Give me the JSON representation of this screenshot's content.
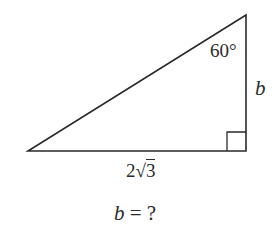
{
  "diagram": {
    "type": "right-triangle",
    "vertices": {
      "left": [
        28,
        151
      ],
      "right_angle": [
        246,
        151
      ],
      "top": [
        246,
        15
      ]
    },
    "right_angle_marker_size": 19,
    "stroke_color": "#2a2a2a",
    "background": "#ffffff"
  },
  "labels": {
    "angle": "60°",
    "side_b": "b",
    "base_coefficient": "2",
    "base_radical_symbol": "√",
    "base_radicand": "3",
    "question_variable": "b",
    "question_rest": " = ?"
  }
}
